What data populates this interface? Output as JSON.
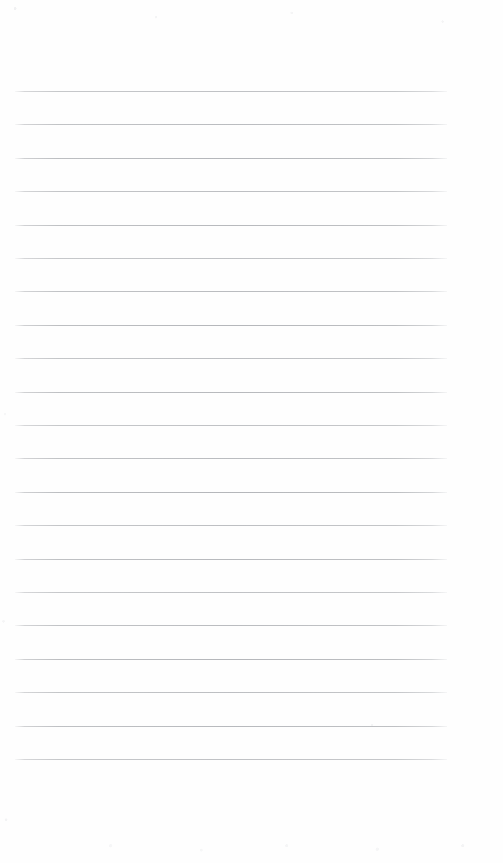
{
  "document": {
    "kind": "scanned-blank-lined-notebook-page",
    "title": "Blank Lined Notebook Page",
    "page_width": 503,
    "page_height": 863,
    "background_color": "#fefefe",
    "has_text": false,
    "has_handwriting": false,
    "header_text": "",
    "footer_text": "",
    "body_text": ""
  },
  "ruling": {
    "style": "wide-ruled horizontal lines",
    "line_color": "#b4b6ba",
    "line_thickness_px": 1,
    "line_count": 21,
    "line_spacing_px": 33.4,
    "first_line_y": 91,
    "last_line_y": 764,
    "line_start_x": 15,
    "line_end_x": 447,
    "line_length_px": 432,
    "left_margin_px": 15,
    "right_margin_px": 56,
    "top_margin_px": 91,
    "bottom_margin_px": 99,
    "margin_rule_visible": false,
    "line_y_positions": [
      91,
      124.4,
      157.8,
      191.2,
      224.6,
      258,
      291.4,
      324.8,
      358.2,
      391.6,
      425,
      458.4,
      491.8,
      525.2,
      558.6,
      592,
      625.4,
      658.8,
      692.2,
      725.6,
      759
    ]
  },
  "artifacts": {
    "description": "faint scanner speckle noise along page edges",
    "noise_color": "#d4d6da",
    "visible": true
  }
}
